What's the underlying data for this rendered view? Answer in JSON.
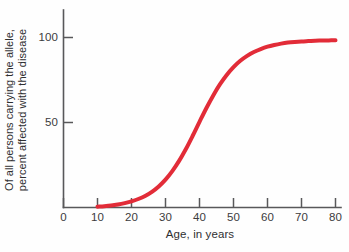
{
  "chart_data": {
    "type": "line",
    "title": "",
    "subtitle": "",
    "xlabel": "Age, in years",
    "ylabel_line1": "Of all persons carrying the allele,",
    "ylabel_line2": "percent affected with the disease",
    "ylabel": "Of all persons carrying the allele, percent affected with the disease",
    "xlim": [
      0,
      85
    ],
    "ylim": [
      0,
      112
    ],
    "xticks": [
      0,
      10,
      20,
      30,
      40,
      50,
      60,
      70,
      80
    ],
    "xticklabels": [
      "0",
      "10",
      "20",
      "30",
      "40",
      "50",
      "60",
      "70",
      "80"
    ],
    "yticks": [
      50,
      100
    ],
    "yticklabels": [
      "50",
      "100"
    ],
    "grid": false,
    "legend": false,
    "legend_position": "none",
    "series": [
      {
        "name": "percent affected",
        "color": "#e22c38",
        "line_width": 4,
        "x": [
          10,
          12,
          14,
          16,
          18,
          20,
          22,
          24,
          26,
          28,
          30,
          32,
          34,
          36,
          38,
          40,
          42,
          44,
          46,
          48,
          50,
          52,
          54,
          56,
          58,
          60,
          62,
          64,
          66,
          68,
          70,
          72,
          74,
          76,
          78,
          80
        ],
        "values": [
          0.5,
          0.8,
          1.2,
          1.8,
          2.6,
          3.6,
          5.0,
          6.8,
          9.2,
          12.4,
          16.4,
          21.4,
          27.4,
          34.4,
          42.2,
          50.4,
          58.4,
          65.8,
          72.4,
          78.0,
          82.6,
          86.3,
          89.2,
          91.5,
          93.2,
          94.6,
          95.6,
          96.4,
          97.0,
          97.4,
          97.7,
          97.9,
          98.1,
          98.2,
          98.3,
          98.4
        ]
      }
    ],
    "annotations": []
  },
  "axes": {
    "x_tick_labels": [
      "0",
      "10",
      "20",
      "30",
      "40",
      "50",
      "60",
      "70",
      "80"
    ],
    "y_tick_labels": [
      "100",
      "50"
    ],
    "x_axis_title": "Age, in years",
    "y_axis_title_line1": "Of all persons carrying the allele,",
    "y_axis_title_line2": "percent affected with the disease"
  },
  "colors": {
    "curve": "#e22c38",
    "axis": "#58585a",
    "text": "#2f2f31",
    "background": "#fefefe"
  }
}
